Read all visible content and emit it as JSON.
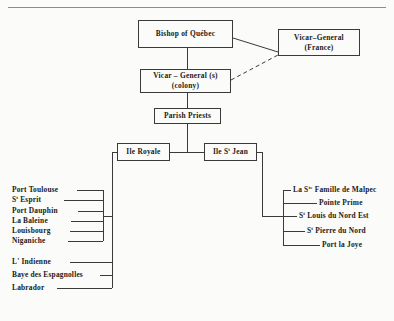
{
  "diagram": {
    "title_present": false,
    "type": "organizational-hierarchy",
    "nodes": {
      "bishop": {
        "label": "Bishop of  Québec"
      },
      "vicar_colony": {
        "line1": "Vicar – General (s)",
        "line2": "(colony)"
      },
      "vicar_france": {
        "line1": "Vicar–General",
        "line2": "(France)"
      },
      "parish_priests": {
        "label": "Parish     Priests"
      },
      "ile_royale": {
        "label_pre": "Ile Royale"
      },
      "ile_st_jean": {
        "label_pre": "Ile S",
        "sup": "t",
        "label_post": " Jean"
      }
    },
    "left_branch": {
      "parent": "ile_royale",
      "items": [
        {
          "pre": "Port Toulouse",
          "sup": "",
          "post": ""
        },
        {
          "pre": "S",
          "sup": "t",
          "post": " Esprit"
        },
        {
          "pre": "Port  Dauphin",
          "sup": "",
          "post": ""
        },
        {
          "pre": "La Baleine",
          "sup": "",
          "post": ""
        },
        {
          "pre": "Louisbourg",
          "sup": "",
          "post": ""
        },
        {
          "pre": "Niganiche",
          "sup": "",
          "post": ""
        },
        {
          "pre": "L' Indienne",
          "sup": "",
          "post": ""
        },
        {
          "pre": "Baye des Espagnolles",
          "sup": "",
          "post": ""
        },
        {
          "pre": "Labrador",
          "sup": "",
          "post": ""
        }
      ]
    },
    "right_branch": {
      "parent": "ile_st_jean",
      "items": [
        {
          "pre": "La S",
          "sup": "te",
          "post": " Famille de Malpec"
        },
        {
          "pre": "Pointe   Prime",
          "sup": "",
          "post": ""
        },
        {
          "pre": "S",
          "sup": "t",
          "post": " Louis  du  Nord  Est"
        },
        {
          "pre": "S",
          "sup": "t",
          "post": " Pierre du Nord"
        },
        {
          "pre": "Port la Joye",
          "sup": "",
          "post": ""
        }
      ]
    },
    "edges": [
      {
        "from": "bishop",
        "to": "vicar_colony",
        "style": "solid"
      },
      {
        "from": "bishop",
        "to": "vicar_france",
        "style": "solid"
      },
      {
        "from": "vicar_colony",
        "to": "vicar_france",
        "style": "dashed"
      },
      {
        "from": "vicar_colony",
        "to": "parish_priests",
        "style": "solid"
      },
      {
        "from": "parish_priests",
        "to": "ile_royale",
        "style": "solid"
      },
      {
        "from": "parish_priests",
        "to": "ile_st_jean",
        "style": "solid"
      }
    ],
    "colors": {
      "background": "#fbfbf9",
      "line": "#3a3a3a",
      "text": "#1a1a1a",
      "rule": "#8d8d8d"
    }
  }
}
